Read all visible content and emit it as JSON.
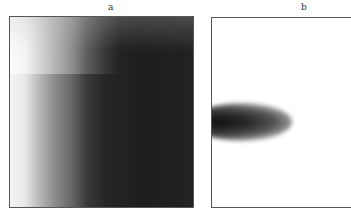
{
  "figure": {
    "panels": [
      {
        "label": "a",
        "description": "grayscale intensity map, light at left edge darkening to near-black toward right"
      },
      {
        "label": "b",
        "description": "white field with dark elongated blob at left edge, mid-height"
      }
    ]
  }
}
